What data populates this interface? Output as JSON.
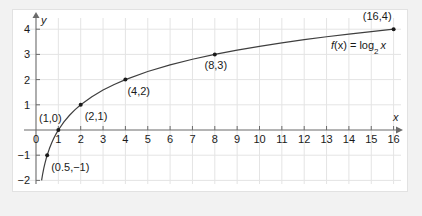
{
  "chart_data": {
    "type": "line",
    "title": "",
    "subtitle": "",
    "xlabel": "x",
    "ylabel": "y",
    "xlim": [
      0,
      16
    ],
    "ylim": [
      -2,
      4.5
    ],
    "grid": true,
    "legend_position": "inline-curve-label",
    "function_label": "f(x) = log",
    "function_label_sub": "2",
    "function_label_arg": "x",
    "function_expression": "f(x) = log_2 x",
    "x_ticks": [
      "0",
      "1",
      "2",
      "3",
      "4",
      "5",
      "6",
      "7",
      "8",
      "9",
      "10",
      "11",
      "12",
      "13",
      "14",
      "15",
      "16"
    ],
    "x_tick_values": [
      0,
      1,
      2,
      3,
      4,
      5,
      6,
      7,
      8,
      9,
      10,
      11,
      12,
      13,
      14,
      15,
      16
    ],
    "y_ticks": [
      "4",
      "3",
      "2",
      "1",
      "-1",
      "-2"
    ],
    "y_tick_values": [
      4,
      3,
      2,
      1,
      -1,
      -2
    ],
    "series": [
      {
        "name": "f(x) = log_2 x",
        "color": "#3f3f3f",
        "x": [
          0.25,
          0.3,
          0.35,
          0.4,
          0.45,
          0.5,
          0.6,
          0.7,
          0.8,
          0.9,
          1,
          1.25,
          1.5,
          1.75,
          2,
          2.5,
          3,
          3.5,
          4,
          5,
          6,
          7,
          8,
          9,
          10,
          11,
          12,
          13,
          14,
          15,
          16
        ],
        "y": [
          -2,
          -1.737,
          -1.515,
          -1.322,
          -1.152,
          -1,
          -0.737,
          -0.515,
          -0.322,
          -0.152,
          0,
          0.322,
          0.585,
          0.807,
          1,
          1.322,
          1.585,
          1.807,
          2,
          2.322,
          2.585,
          2.807,
          3,
          3.17,
          3.322,
          3.459,
          3.585,
          3.7,
          3.807,
          3.907,
          4
        ]
      }
    ],
    "marked_points": [
      {
        "label": "(0.5,-1)",
        "x": 0.5,
        "y": -1
      },
      {
        "label": "(1,0)",
        "x": 1,
        "y": 0
      },
      {
        "label": "(2,1)",
        "x": 2,
        "y": 1
      },
      {
        "label": "(4,2)",
        "x": 4,
        "y": 2
      },
      {
        "label": "(8,3)",
        "x": 8,
        "y": 3
      },
      {
        "label": "(16,4)",
        "x": 16,
        "y": 4
      }
    ],
    "colors": {
      "curve": "#3f3f3f",
      "axis": "#6b6b6b",
      "grid": "#e4e4e4",
      "point": "#1a1a1a",
      "text": "#1a1a1a",
      "plot_background": "#ffffff",
      "page_background": "#f2f2f2"
    }
  }
}
